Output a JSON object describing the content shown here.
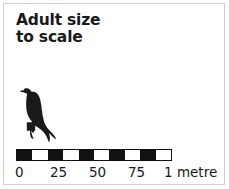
{
  "panel": {
    "title_lines": [
      "Adult size",
      "to scale"
    ],
    "border_color": "#cfcfcf",
    "background_color": "#ffffff"
  },
  "figure": {
    "icon": "bird-of-prey-silhouette",
    "color": "#1a1a1a"
  },
  "scale": {
    "bar_color": "#111111",
    "blank_color": "#ffffff",
    "segment_count": 10,
    "segments": [
      "fill",
      "blank",
      "fill",
      "blank",
      "fill",
      "blank",
      "fill",
      "blank",
      "fill",
      "blank"
    ],
    "unit_note": "1 metre",
    "ticks": [
      {
        "label": "0",
        "value": 0,
        "left": 11
      },
      {
        "label": "25",
        "value": 25,
        "left": 46
      },
      {
        "label": "50",
        "value": 50,
        "left": 85
      },
      {
        "label": "75",
        "value": 75,
        "left": 124
      },
      {
        "label": "1 metre",
        "value": 100,
        "left": 160
      }
    ]
  },
  "chart_data": {
    "type": "bar",
    "title": "Adult size to scale",
    "xlabel": "centimetres",
    "ylabel": "",
    "categories": [
      "0",
      "25",
      "50",
      "75",
      "1 metre"
    ],
    "values": [
      0,
      25,
      50,
      75,
      100
    ],
    "xlim": [
      0,
      100
    ],
    "grid": false,
    "legend": "none",
    "annotations": [
      "Adult size to scale",
      "1 metre"
    ]
  }
}
